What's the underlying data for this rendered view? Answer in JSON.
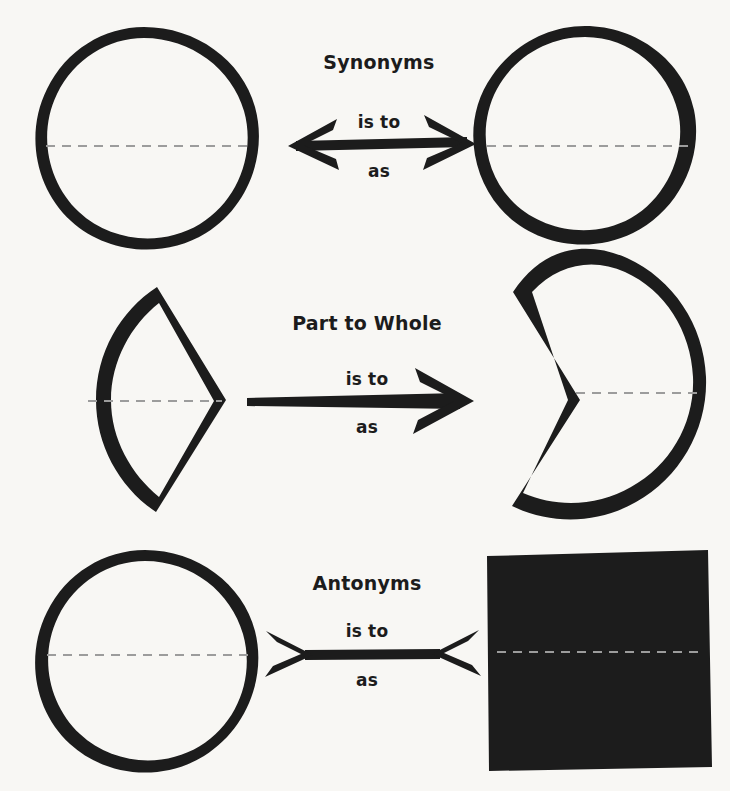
{
  "canvas": {
    "width": 730,
    "height": 791,
    "background_color": "#f8f7f4",
    "ink_color": "#1c1c1c",
    "dashed_line_color": "#9c9c9c",
    "title": "Analogy Types Diagram"
  },
  "relation_labels": {
    "top": "is to",
    "bottom": "as"
  },
  "rows": [
    {
      "id": "synonyms",
      "title": "Synonyms",
      "relation_top": "is to",
      "relation_bottom": "as",
      "arrow_style": "double-headed-outward",
      "left_shape": "circle",
      "right_shape": "circle",
      "left_shape_label": "whole-circle",
      "right_shape_label": "whole-circle",
      "meaning": "two equal wholes — same meaning"
    },
    {
      "id": "part-to-whole",
      "title": "Part to Whole",
      "relation_top": "is to",
      "relation_bottom": "as",
      "arrow_style": "single-headed-right",
      "left_shape": "pie-wedge",
      "right_shape": "pie-with-wedge-removed",
      "left_shape_label": "sector-part",
      "right_shape_label": "circle-minus-sector",
      "meaning": "a slice relates to the remaining whole"
    },
    {
      "id": "antonyms",
      "title": "Antonyms",
      "relation_top": "is to",
      "relation_bottom": "as",
      "arrow_style": "double-headed-inward",
      "left_shape": "circle",
      "right_shape": "square",
      "left_shape_label": "whole-circle",
      "right_shape_label": "whole-square",
      "meaning": "two opposing forms — opposite meaning"
    }
  ]
}
